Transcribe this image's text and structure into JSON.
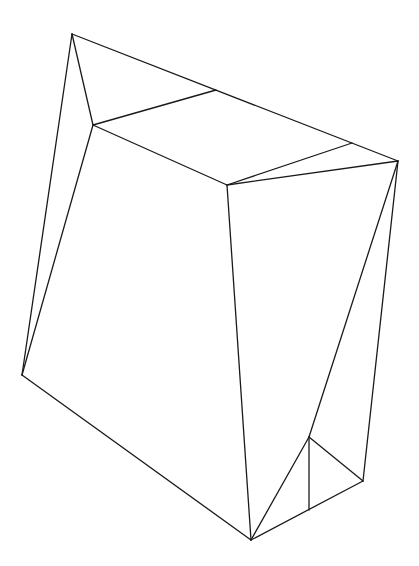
{
  "diagram": {
    "type": "wireframe-polyhedron",
    "stroke_color": "#1a1a1a",
    "background": "#ffffff",
    "vertices": {
      "A": [
        72,
        34
      ],
      "B": [
        93,
        125
      ],
      "C": [
        216,
        90
      ],
      "D": [
        352,
        143
      ],
      "E": [
        398,
        161
      ],
      "F": [
        227,
        185
      ],
      "G": [
        22,
        375
      ],
      "H": [
        251,
        540
      ],
      "I": [
        309,
        437
      ],
      "J": [
        309,
        510
      ],
      "K": [
        363,
        481
      ]
    },
    "edges": [
      [
        "A",
        "E"
      ],
      [
        "A",
        "B"
      ],
      [
        "A",
        "G"
      ],
      [
        "B",
        "C"
      ],
      [
        "B",
        "F"
      ],
      [
        "B",
        "G"
      ],
      [
        "D",
        "F"
      ],
      [
        "F",
        "E"
      ],
      [
        "F",
        "H"
      ],
      [
        "G",
        "H"
      ],
      [
        "E",
        "I"
      ],
      [
        "E",
        "K"
      ],
      [
        "I",
        "H"
      ],
      [
        "I",
        "J"
      ],
      [
        "I",
        "K"
      ],
      [
        "H",
        "K"
      ]
    ]
  }
}
